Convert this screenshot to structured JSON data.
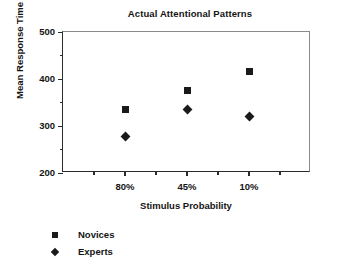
{
  "chart_data": {
    "type": "scatter",
    "title": "Actual Attentional Patterns",
    "xlabel": "Stimulus Probability",
    "ylabel": "Mean Response Time (in ms)",
    "categories": [
      "80%",
      "45%",
      "10%"
    ],
    "ylim": [
      200,
      500
    ],
    "y_major_ticks": [
      200,
      300,
      400,
      500
    ],
    "y_minor_ticks": [
      250,
      350,
      450
    ],
    "grid": false,
    "legend_position": "below-left",
    "series": [
      {
        "name": "Novices",
        "marker": "square",
        "values": [
          335,
          375,
          415
        ]
      },
      {
        "name": "Experts",
        "marker": "diamond",
        "values": [
          277,
          336,
          321
        ]
      }
    ],
    "colors": {
      "marker": "#1a1a1a",
      "axis": "#2b2b2b",
      "frame": "#8a8a8a",
      "background": "#ffffff",
      "text": "#141414"
    }
  },
  "axis": {
    "y_tick_labels": [
      "500",
      "400",
      "300",
      "200"
    ],
    "x_tick_labels": [
      "80%",
      "45%",
      "10%"
    ]
  },
  "legend": {
    "items": [
      {
        "label": "Novices",
        "marker": "square"
      },
      {
        "label": "Experts",
        "marker": "diamond"
      }
    ]
  }
}
